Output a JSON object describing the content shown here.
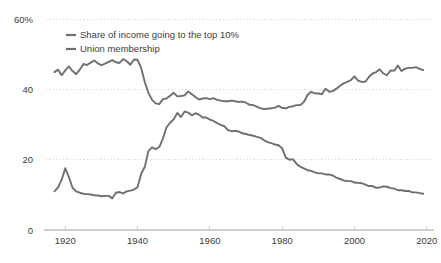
{
  "chart_data": {
    "type": "line",
    "title": "",
    "subtitle": "",
    "xlabel": "",
    "ylabel": "",
    "xlim": [
      1913,
      2022
    ],
    "ylim": [
      0,
      60
    ],
    "grid": true,
    "grid_axis": "y",
    "legend_position": "top-left",
    "y_ticks": [
      0,
      20,
      40,
      60
    ],
    "y_tick_labels": [
      "0",
      "20",
      "40",
      "60%"
    ],
    "x_ticks": [
      1920,
      1940,
      1960,
      1980,
      2000,
      2020
    ],
    "x_tick_labels": [
      "1920",
      "1940",
      "1960",
      "1980",
      "2000",
      "2020"
    ],
    "series": [
      {
        "name": "Share of income going to the top 10%",
        "color": "#6f6f6f",
        "x": [
          1917,
          1918,
          1919,
          1920,
          1921,
          1922,
          1923,
          1924,
          1925,
          1926,
          1927,
          1928,
          1929,
          1930,
          1931,
          1932,
          1933,
          1934,
          1935,
          1936,
          1937,
          1938,
          1939,
          1940,
          1941,
          1942,
          1943,
          1944,
          1945,
          1946,
          1947,
          1948,
          1949,
          1950,
          1951,
          1952,
          1953,
          1954,
          1955,
          1956,
          1957,
          1958,
          1959,
          1960,
          1961,
          1962,
          1963,
          1964,
          1965,
          1966,
          1967,
          1968,
          1969,
          1970,
          1971,
          1972,
          1973,
          1974,
          1975,
          1976,
          1977,
          1978,
          1979,
          1980,
          1981,
          1982,
          1983,
          1984,
          1985,
          1986,
          1987,
          1988,
          1989,
          1990,
          1991,
          1992,
          1993,
          1994,
          1995,
          1996,
          1997,
          1998,
          1999,
          2000,
          2001,
          2002,
          2003,
          2004,
          2005,
          2006,
          2007,
          2008,
          2009,
          2010,
          2011,
          2012,
          2013,
          2014,
          2015,
          2016,
          2017,
          2018,
          2019
        ],
        "y": [
          44.9,
          45.6,
          44.0,
          45.4,
          46.5,
          45.2,
          44.3,
          45.6,
          47.2,
          46.9,
          47.6,
          48.2,
          47.4,
          46.9,
          47.3,
          47.8,
          48.3,
          47.7,
          47.5,
          48.6,
          48.0,
          47.0,
          48.5,
          48.4,
          46.0,
          42.0,
          39.0,
          37.0,
          36.0,
          35.8,
          37.2,
          37.4,
          38.2,
          39.0,
          38.0,
          38.1,
          38.3,
          39.4,
          38.6,
          37.8,
          37.1,
          37.4,
          37.5,
          37.2,
          37.5,
          37.0,
          36.8,
          36.6,
          36.6,
          36.8,
          36.6,
          36.4,
          36.5,
          36.2,
          35.6,
          35.5,
          35.1,
          34.6,
          34.4,
          34.5,
          34.6,
          34.8,
          35.3,
          34.7,
          34.6,
          35.0,
          35.2,
          35.5,
          35.5,
          36.4,
          38.4,
          39.3,
          38.9,
          38.8,
          38.6,
          40.2,
          39.3,
          39.5,
          40.2,
          41.0,
          41.7,
          42.1,
          42.6,
          43.7,
          42.5,
          42.1,
          42.2,
          43.5,
          44.5,
          44.9,
          45.7,
          44.5,
          44.0,
          45.4,
          45.3,
          46.8,
          45.2,
          45.9,
          46.1,
          46.1,
          46.3,
          45.8,
          45.5
        ]
      },
      {
        "name": "Union membership",
        "color": "#6f6f6f",
        "x": [
          1917,
          1918,
          1919,
          1920,
          1921,
          1922,
          1923,
          1924,
          1925,
          1926,
          1927,
          1928,
          1929,
          1930,
          1931,
          1932,
          1933,
          1934,
          1935,
          1936,
          1937,
          1938,
          1939,
          1940,
          1941,
          1942,
          1943,
          1944,
          1945,
          1946,
          1947,
          1948,
          1949,
          1950,
          1951,
          1952,
          1953,
          1954,
          1955,
          1956,
          1957,
          1958,
          1959,
          1960,
          1961,
          1962,
          1963,
          1964,
          1965,
          1966,
          1967,
          1968,
          1969,
          1970,
          1971,
          1972,
          1973,
          1974,
          1975,
          1976,
          1977,
          1978,
          1979,
          1980,
          1981,
          1982,
          1983,
          1984,
          1985,
          1986,
          1987,
          1988,
          1989,
          1990,
          1991,
          1992,
          1993,
          1994,
          1995,
          1996,
          1997,
          1998,
          1999,
          2000,
          2001,
          2002,
          2003,
          2004,
          2005,
          2006,
          2007,
          2008,
          2009,
          2010,
          2011,
          2012,
          2013,
          2014,
          2015,
          2016,
          2017,
          2018,
          2019
        ],
        "y": [
          11.0,
          12.1,
          14.3,
          17.6,
          15.0,
          12.0,
          11.0,
          10.6,
          10.3,
          10.2,
          10.1,
          9.9,
          9.8,
          9.6,
          9.7,
          9.7,
          9.0,
          10.6,
          10.8,
          10.4,
          11.0,
          11.2,
          11.5,
          12.2,
          16.0,
          18.0,
          22.5,
          23.5,
          23.0,
          23.6,
          26.0,
          29.2,
          30.5,
          31.5,
          33.3,
          32.1,
          33.7,
          33.4,
          32.6,
          33.2,
          32.8,
          32.0,
          32.0,
          31.4,
          31.0,
          30.4,
          29.9,
          29.5,
          28.4,
          28.1,
          28.2,
          28.0,
          27.5,
          27.3,
          27.0,
          26.8,
          26.5,
          26.2,
          25.5,
          25.0,
          24.7,
          24.3,
          24.1,
          23.2,
          20.6,
          20.0,
          20.1,
          18.8,
          18.0,
          17.5,
          17.0,
          16.8,
          16.4,
          16.1,
          16.1,
          15.8,
          15.8,
          15.5,
          14.9,
          14.5,
          14.1,
          13.9,
          13.9,
          13.5,
          13.4,
          13.3,
          12.9,
          12.5,
          12.5,
          12.0,
          12.1,
          12.4,
          12.3,
          11.9,
          11.8,
          11.3,
          11.3,
          11.1,
          11.1,
          10.7,
          10.7,
          10.5,
          10.3
        ]
      }
    ],
    "legend": [
      "Share of income going to the top 10%",
      "Union membership"
    ]
  },
  "colors": {
    "line": "#6f6f6f",
    "grid": "#d9d9d9",
    "axis": "#cfcfcf",
    "text": "#3c3c3c",
    "background": "#ffffff"
  }
}
